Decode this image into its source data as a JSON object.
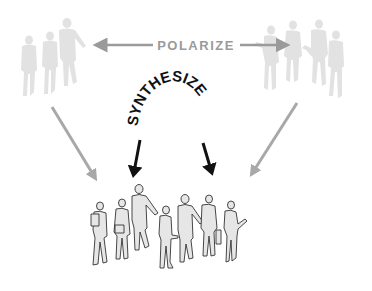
{
  "diagram": {
    "polarize_label": "POLARIZE",
    "synthesize_label": "SYNTHESIZE",
    "colors": {
      "background": "#ffffff",
      "polarize_text": "#9a9a9a",
      "polarize_arrows": "#9a9a9a",
      "faded_figures": "#e2e2e2",
      "synthesize_text": "#111111",
      "synthesize_arrows": "#111111",
      "converging_arrows": "#a8a8a8",
      "group_figure_fill": "#e6e6e6",
      "group_figure_outline": "#333333"
    },
    "groups": {
      "left_faded": {
        "figure_count": 3
      },
      "right_faded": {
        "figure_count": 4
      },
      "bottom_united": {
        "figure_count": 7
      }
    }
  }
}
